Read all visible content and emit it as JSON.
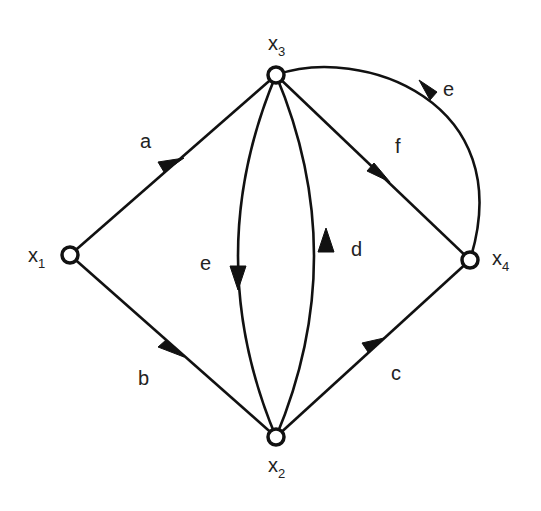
{
  "diagram": {
    "type": "directed-graph",
    "nodes": [
      {
        "id": "x1",
        "label": "x",
        "sub": "1"
      },
      {
        "id": "x2",
        "label": "x",
        "sub": "2"
      },
      {
        "id": "x3",
        "label": "x",
        "sub": "3"
      },
      {
        "id": "x4",
        "label": "x",
        "sub": "4"
      }
    ],
    "edges": [
      {
        "label": "a",
        "from": "x1",
        "to": "x3"
      },
      {
        "label": "b",
        "from": "x1",
        "to": "x2"
      },
      {
        "label": "c",
        "from": "x2",
        "to": "x4"
      },
      {
        "label": "d",
        "from": "x2",
        "to": "x3"
      },
      {
        "label": "e",
        "from": "x3",
        "to": "x2"
      },
      {
        "label": "f",
        "from": "x3",
        "to": "x4"
      },
      {
        "label": "e",
        "from": "x4",
        "to": "x3"
      }
    ]
  }
}
